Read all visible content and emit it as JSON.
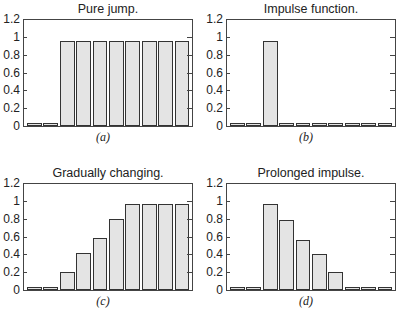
{
  "chart_data": [
    {
      "type": "bar",
      "panel": "a",
      "title": "Pure jump.",
      "sublabel": "(a)",
      "categories": [
        "1",
        "2",
        "3",
        "4",
        "5",
        "6",
        "7",
        "8",
        "9",
        "10"
      ],
      "values": [
        0.02,
        0.02,
        0.95,
        0.95,
        0.95,
        0.95,
        0.95,
        0.95,
        0.95,
        0.95
      ],
      "xlabel": "",
      "ylabel": "",
      "ylim": [
        0,
        1.2
      ],
      "yticks": [
        "0",
        "0.2",
        "0.4",
        "0.6",
        "0.8",
        "1",
        "1.2"
      ],
      "grid": false,
      "legend": null
    },
    {
      "type": "bar",
      "panel": "b",
      "title": "Impulse function.",
      "sublabel": "(b)",
      "categories": [
        "1",
        "2",
        "3",
        "4",
        "5",
        "6",
        "7",
        "8",
        "9",
        "10"
      ],
      "values": [
        0.02,
        0.02,
        0.95,
        0.02,
        0.02,
        0.02,
        0.02,
        0.02,
        0.02,
        0.02
      ],
      "xlabel": "",
      "ylabel": "",
      "ylim": [
        0,
        1.2
      ],
      "yticks": [
        "0",
        "0.2",
        "0.4",
        "0.6",
        "0.8",
        "1",
        "1.2"
      ],
      "grid": false,
      "legend": null
    },
    {
      "type": "bar",
      "panel": "c",
      "title": "Gradually changing.",
      "sublabel": "(c)",
      "categories": [
        "1",
        "2",
        "3",
        "4",
        "5",
        "6",
        "7",
        "8",
        "9",
        "10"
      ],
      "values": [
        0.02,
        0.02,
        0.2,
        0.41,
        0.58,
        0.8,
        0.97,
        0.97,
        0.97,
        0.97
      ],
      "xlabel": "",
      "ylabel": "",
      "ylim": [
        0,
        1.2
      ],
      "yticks": [
        "0",
        "0.2",
        "0.4",
        "0.6",
        "0.8",
        "1",
        "1.2"
      ],
      "grid": false,
      "legend": null
    },
    {
      "type": "bar",
      "panel": "d",
      "title": "Prolonged impulse.",
      "sublabel": "(d)",
      "categories": [
        "1",
        "2",
        "3",
        "4",
        "5",
        "6",
        "7",
        "8",
        "9",
        "10"
      ],
      "values": [
        0.02,
        0.02,
        0.97,
        0.79,
        0.56,
        0.4,
        0.2,
        0.02,
        0.02,
        0.02
      ],
      "xlabel": "",
      "ylabel": "",
      "ylim": [
        0,
        1.2
      ],
      "yticks": [
        "0",
        "0.2",
        "0.4",
        "0.6",
        "0.8",
        "1",
        "1.2"
      ],
      "grid": false,
      "legend": null
    }
  ],
  "colors": {
    "bar_fill": "#e4e4e4",
    "bar_edge": "#333333",
    "axis": "#444444"
  }
}
